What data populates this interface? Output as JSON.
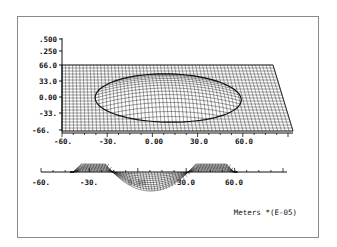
{
  "figure": {
    "units_label": "Meters *(E-05)",
    "z_ticks": [
      ".500",
      ".250"
    ],
    "y_ticks": [
      "66.0",
      "33.0",
      "0.00",
      "-33.",
      "-66."
    ],
    "x_ticks_top": [
      "-60.",
      "-30.",
      "0.00",
      "30.0",
      "60.0"
    ],
    "x_ticks_bottom": [
      "-60.",
      "-30.",
      "0.00",
      "30.0",
      "60.0"
    ],
    "colors": {
      "ink": "#111111",
      "frame": "#8a8a8a",
      "background": "#ffffff"
    }
  },
  "chart_data": [
    {
      "type": "surface-wireframe",
      "title": "",
      "xlabel": "Meters *(E-05)",
      "ylabel": "",
      "zlabel": "",
      "x_ticks": [
        -60,
        -30,
        0,
        30,
        60
      ],
      "y_ticks": [
        66,
        33,
        0,
        -33,
        -66
      ],
      "z_ticks": [
        0.5,
        0.25
      ],
      "xlim": [
        -66,
        96
      ],
      "ylim": [
        -66,
        66
      ],
      "description": "3D wireframe view of a flat plane with a circular raised region (radius ~45) centered near x=10, y=0",
      "grid": true
    },
    {
      "type": "line",
      "title": "",
      "xlabel": "Meters *(E-05)",
      "x_ticks": [
        -60,
        -30,
        0,
        30,
        60
      ],
      "description": "Side profile: flat baseline with a shallow rim from x~-38 to x~60 and a deep bowl centered near x~8 spanning roughly -20 to 35",
      "x": [
        -60,
        -38,
        -30,
        -20,
        -10,
        0,
        8,
        20,
        30,
        40,
        50,
        60,
        90
      ],
      "values": [
        0,
        0,
        0.15,
        0.12,
        -0.35,
        -0.6,
        -0.65,
        -0.45,
        -0.1,
        0.12,
        0.14,
        0.1,
        0
      ],
      "grid": false
    }
  ]
}
